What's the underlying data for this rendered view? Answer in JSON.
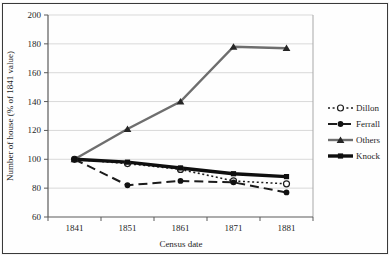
{
  "frame": {
    "border_color": "#3a3a3a",
    "background": "#fefefe"
  },
  "colors": {
    "gridline": "#d9d9d9",
    "axis_line": "#5a5a5a",
    "plot_right_border": "#a8a8a8",
    "text": "#1f1f1f"
  },
  "chart_data": {
    "type": "line",
    "title": "",
    "xlabel": "Census date",
    "ylabel": "Number of house (% of 1841 value)",
    "categories": [
      "1841",
      "1851",
      "1861",
      "1871",
      "1881"
    ],
    "ylim": [
      60,
      200
    ],
    "yticks": [
      200,
      180,
      160,
      140,
      120,
      100,
      80,
      60
    ],
    "grid": true,
    "legend_position": "right",
    "series": [
      {
        "name": "Dillon",
        "values": [
          100,
          97,
          93,
          85,
          83
        ],
        "color": "#1c1c1c",
        "line_style": "dotted",
        "marker": "open-circle",
        "marker_color": "#1c1c1c"
      },
      {
        "name": "Ferrall",
        "values": [
          100,
          82,
          85,
          84,
          77
        ],
        "color": "#1c1c1c",
        "line_style": "dashed",
        "marker": "filled-circle",
        "marker_color": "#111111"
      },
      {
        "name": "Others",
        "values": [
          100,
          121,
          140,
          178,
          177
        ],
        "color": "#6e6e6e",
        "line_style": "solid",
        "marker": "filled-triangle",
        "marker_color": "#262626"
      },
      {
        "name": "Knock",
        "values": [
          100,
          98,
          94,
          90,
          88
        ],
        "color": "#0f0f0f",
        "line_style": "solid-thick",
        "marker": "filled-square",
        "marker_color": "#0f0f0f"
      }
    ]
  }
}
